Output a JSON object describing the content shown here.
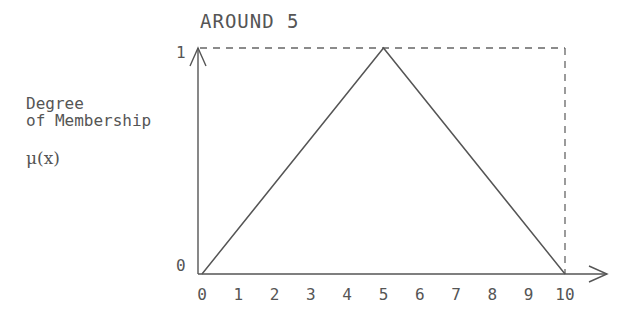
{
  "chart_data": {
    "type": "line",
    "title": "AROUND 5",
    "ylabel": [
      "Degree",
      "of Membership"
    ],
    "ysymbol": "μ(x)",
    "xlabel": "",
    "x": [
      0,
      5,
      10
    ],
    "y": [
      0,
      1,
      0
    ],
    "xlim": [
      0,
      10
    ],
    "ylim": [
      0,
      1
    ],
    "xticks": [
      "0",
      "1",
      "2",
      "3",
      "4",
      "5",
      "6",
      "7",
      "8",
      "9",
      "10"
    ],
    "yticks": [
      "0",
      "1"
    ],
    "grid": false,
    "legend": null,
    "annotations": [
      "dashed bounding box at y=1 and x=10"
    ]
  },
  "labels": {
    "title": "AROUND 5",
    "ylabel_line1": "Degree",
    "ylabel_line2": "of Membership",
    "ysymbol": "μ(x)",
    "ytick_0": "0",
    "ytick_1": "1"
  }
}
